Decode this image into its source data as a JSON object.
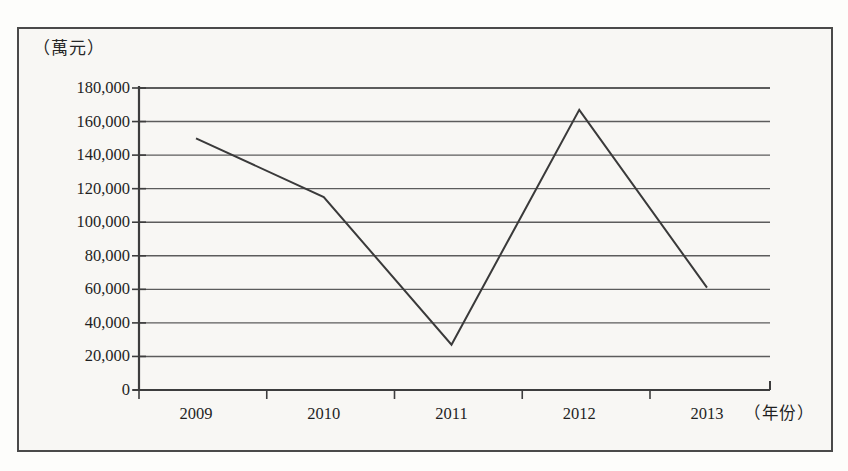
{
  "chart_data": {
    "type": "line",
    "title": "",
    "subtitle": "",
    "xlabel": "（年份）",
    "ylabel": "（萬元）",
    "categories": [
      "2009",
      "2010",
      "2011",
      "2012",
      "2013"
    ],
    "series": [
      {
        "name": "",
        "values": [
          150000,
          115000,
          27000,
          167000,
          61000
        ]
      }
    ],
    "ylim": [
      0,
      180000
    ],
    "yticks": [
      0,
      20000,
      40000,
      60000,
      80000,
      100000,
      120000,
      140000,
      160000,
      180000
    ],
    "ytick_labels": [
      "0",
      "20,000",
      "40,000",
      "60,000",
      "80,000",
      "100,000",
      "120,000",
      "140,000",
      "160,000",
      "180,000"
    ],
    "xtick_labels": [
      "2009",
      "2010",
      "2011",
      "2012",
      "2013"
    ],
    "grid": true,
    "grid_axis": "y",
    "legend": false,
    "legend_position": "none",
    "markers": false,
    "line_color": "#3a3a3a",
    "grid_color": "#5c5c5c",
    "axis_color": "#3d3d3d",
    "background_color": "#f8f7f4",
    "frame_color": "#4a4a4a"
  }
}
